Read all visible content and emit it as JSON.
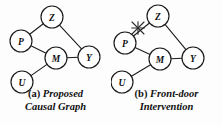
{
  "figure": {
    "background_color": "#fdfdfd",
    "stroke_color": "#1a1a1a",
    "node_fill": "#ffffff",
    "width": 222,
    "height": 125
  },
  "chart_data": {
    "type": "diagram",
    "title": "",
    "subtitle": "",
    "diagram_kind": "causal-graph",
    "panels": [
      {
        "id": "a",
        "caption_tag": "(a)",
        "caption_line_1": "Proposed",
        "caption_line_2": "Causal Graph",
        "caption_full": "(a) Proposed Causal Graph",
        "nodes": [
          {
            "id": "Z",
            "label": "Z",
            "x": 52,
            "y": 17,
            "r": 11
          },
          {
            "id": "P",
            "label": "P",
            "x": 21,
            "y": 41,
            "r": 11
          },
          {
            "id": "M",
            "label": "M",
            "x": 56,
            "y": 58,
            "r": 11
          },
          {
            "id": "Y",
            "label": "Y",
            "x": 89,
            "y": 57,
            "r": 11
          },
          {
            "id": "U",
            "label": "U",
            "x": 22,
            "y": 82,
            "r": 11
          }
        ],
        "edges": [
          {
            "from": "P",
            "to": "Z",
            "cut": false
          },
          {
            "from": "Z",
            "to": "Y",
            "cut": false
          },
          {
            "from": "P",
            "to": "M",
            "cut": false
          },
          {
            "from": "M",
            "to": "Y",
            "cut": false
          },
          {
            "from": "U",
            "to": "M",
            "cut": false
          }
        ],
        "cut_marks": []
      },
      {
        "id": "b",
        "caption_tag": "(b)",
        "caption_line_1": "Front-door",
        "caption_line_2": "Intervention",
        "caption_full": "(b) Front-door Intervention",
        "nodes": [
          {
            "id": "Z",
            "label": "Z",
            "x": 47,
            "y": 16,
            "r": 11
          },
          {
            "id": "P",
            "label": "P",
            "x": 14,
            "y": 43,
            "r": 11
          },
          {
            "id": "M",
            "label": "M",
            "x": 49,
            "y": 59,
            "r": 11
          },
          {
            "id": "Y",
            "label": "Y",
            "x": 82,
            "y": 58,
            "r": 11
          },
          {
            "id": "U",
            "label": "U",
            "x": 11,
            "y": 82,
            "r": 11
          }
        ],
        "edges": [
          {
            "from": "P",
            "to": "Z",
            "cut": true
          },
          {
            "from": "Z",
            "to": "Y",
            "cut": false
          },
          {
            "from": "P",
            "to": "M",
            "cut": false
          },
          {
            "from": "M",
            "to": "Y",
            "cut": false
          },
          {
            "from": "U",
            "to": "M",
            "cut": false
          }
        ],
        "cut_marks": [
          {
            "on_edge": "P-Z",
            "x": 27,
            "y": 28,
            "size": 6,
            "symbol": "x-cross"
          }
        ]
      }
    ]
  }
}
